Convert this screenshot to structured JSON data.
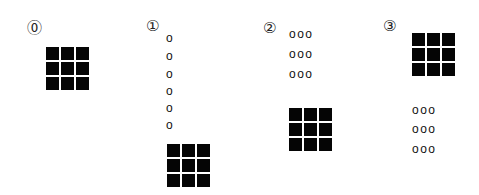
{
  "panels": [
    {
      "label": "⓪",
      "grid": {
        "rows": 3,
        "cols": 3
      },
      "o_rows": []
    },
    {
      "label": "①",
      "o_rows": [
        "o",
        "o",
        "o",
        "o",
        "o",
        "o"
      ],
      "grid": {
        "rows": 3,
        "cols": 3
      }
    },
    {
      "label": "②",
      "o_rows": [
        "ooo",
        "ooo",
        "ooo"
      ],
      "grid": {
        "rows": 3,
        "cols": 3
      }
    },
    {
      "label": "③",
      "grid": {
        "rows": 3,
        "cols": 3
      },
      "o_rows": [
        "ooo",
        "ooo",
        "ooo"
      ]
    }
  ],
  "colors": {
    "square": "#050505",
    "background": "#ffffff"
  }
}
